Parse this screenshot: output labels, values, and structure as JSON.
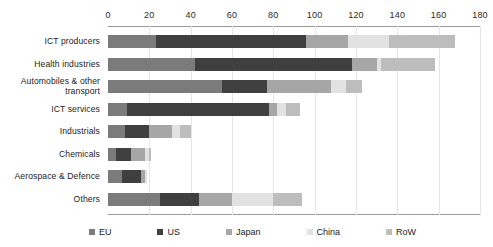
{
  "chart_data": {
    "type": "bar",
    "orientation": "horizontal",
    "stacked": true,
    "title": "",
    "subtitle": "",
    "xlabel": "",
    "ylabel": "",
    "xlim": [
      0,
      180
    ],
    "xticks": [
      0,
      20,
      40,
      60,
      80,
      100,
      120,
      140,
      160,
      180
    ],
    "xtick_labels": [
      "0",
      "20",
      "40",
      "60",
      "80",
      "100",
      "120",
      "140",
      "160",
      "180"
    ],
    "grid": true,
    "grid_axis": "x",
    "legend_position": "bottom",
    "categories": [
      "ICT producers",
      "Health industries",
      "Automobiles & other transport",
      "ICT services",
      "Industrials",
      "Chemicals",
      "Aerospace & Defence",
      "Others"
    ],
    "series": [
      {
        "name": "EU",
        "color": "#7b7b7b",
        "values": [
          23,
          42,
          55,
          9,
          8,
          4,
          7,
          25
        ]
      },
      {
        "name": "US",
        "color": "#3f3f3f",
        "values": [
          73,
          76,
          22,
          69,
          12,
          7,
          9,
          19
        ]
      },
      {
        "name": "Japan",
        "color": "#a6a6a6",
        "values": [
          20,
          12,
          31,
          4,
          11,
          7,
          2,
          16
        ]
      },
      {
        "name": "China",
        "color": "#e2e2e2",
        "values": [
          20,
          2,
          7,
          4,
          4,
          2,
          1,
          20
        ]
      },
      {
        "name": "RoW",
        "color": "#bdbdbd",
        "values": [
          32,
          26,
          8,
          7,
          5,
          1,
          0,
          14
        ]
      }
    ],
    "totals": [
      168,
      158,
      123,
      93,
      40,
      21,
      19,
      94
    ]
  },
  "legend": {
    "items": [
      {
        "label": "EU",
        "color": "#7b7b7b"
      },
      {
        "label": "US",
        "color": "#3f3f3f"
      },
      {
        "label": "Japan",
        "color": "#a6a6a6"
      },
      {
        "label": "China",
        "color": "#e2e2e2"
      },
      {
        "label": "RoW",
        "color": "#bdbdbd"
      }
    ]
  },
  "axis": {
    "ticks": [
      "0",
      "20",
      "40",
      "60",
      "80",
      "100",
      "120",
      "140",
      "160",
      "180"
    ]
  }
}
